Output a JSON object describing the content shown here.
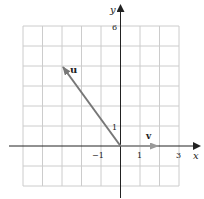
{
  "figure": {
    "axes": {
      "x_label": "x",
      "y_label": "y",
      "x_ticks": [
        {
          "value": -1,
          "label": "−1"
        },
        {
          "value": 1,
          "label": "1"
        },
        {
          "value": 3,
          "label": "3"
        }
      ],
      "y_ticks": [
        {
          "value": 1,
          "label": "1"
        },
        {
          "value": 6,
          "label": "6"
        }
      ],
      "grid": {
        "x_min": -5,
        "x_max": 3,
        "y_min": -2,
        "y_max": 6
      }
    },
    "vectors": [
      {
        "name": "u",
        "label": "u",
        "components": [
          -3,
          4
        ],
        "color": "#777777"
      },
      {
        "name": "v",
        "label": "v",
        "components": [
          2,
          0
        ],
        "color": "#999999"
      }
    ],
    "colors": {
      "grid": "#cccccc",
      "axis": "#222222"
    }
  }
}
